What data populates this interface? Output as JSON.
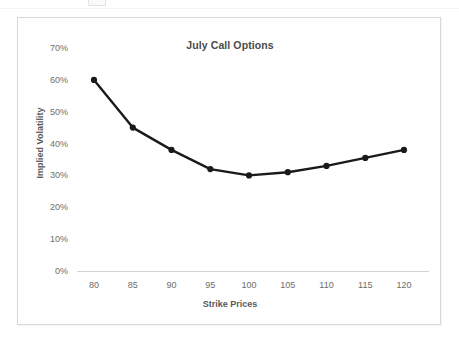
{
  "chart_data": {
    "type": "line",
    "title": "July Call Options",
    "xlabel": "Strike Prices",
    "ylabel": "Implied Volatility",
    "categories": [
      80,
      85,
      90,
      95,
      100,
      105,
      110,
      115,
      120
    ],
    "x": [
      80,
      85,
      90,
      95,
      100,
      105,
      110,
      115,
      120
    ],
    "values": [
      60,
      45,
      38,
      32,
      30,
      31,
      33,
      35.5,
      38
    ],
    "series": [
      {
        "name": "Implied Volatility",
        "values": [
          60,
          45,
          38,
          32,
          30,
          31,
          33,
          35.5,
          38
        ],
        "color": "#1a1a1a",
        "marker": "circle"
      }
    ],
    "x_tick_labels": [
      "80",
      "85",
      "90",
      "95",
      "100",
      "105",
      "110",
      "115",
      "120"
    ],
    "y_tick_labels": [
      "0%",
      "10%",
      "20%",
      "30%",
      "40%",
      "50%",
      "60%",
      "70%"
    ],
    "y_ticks": [
      0,
      10,
      20,
      30,
      40,
      50,
      60,
      70
    ],
    "ylim": [
      0,
      70
    ],
    "xlim": [
      80,
      120
    ],
    "y_unit": "%",
    "grid": false,
    "legend": false,
    "legend_position": "none",
    "axis_line_color": "#d4d4d4",
    "tick_label_color": "#6d6d6d",
    "title_color": "#4a4a4a",
    "background": "#ffffff",
    "frame_border_color": "#d8d8d8"
  }
}
